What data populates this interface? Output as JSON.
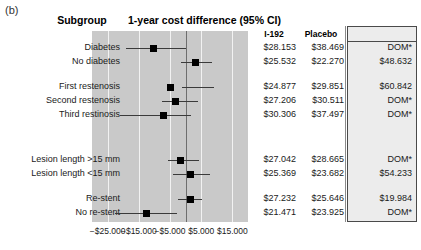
{
  "figure": {
    "panel_label": "(b)",
    "headers": {
      "subgroup": "Subgroup",
      "plot": "1-year cost difference (95% CI)",
      "i192": "I-192",
      "placebo": "Placebo",
      "ce_ratio": "C/E ratio"
    }
  },
  "chart_data": {
    "type": "forest",
    "title": "1-year cost difference (95% CI)",
    "xlabel": "",
    "ylabel": "Subgroup",
    "xlim": [
      -30000,
      20000
    ],
    "grid": true,
    "reference_line": 0,
    "tick_labels": [
      "−$25.000",
      "−$15.000",
      "−$5.000",
      "$5.000",
      "$15.000"
    ],
    "tick_values": [
      -25000,
      -15000,
      -5000,
      5000,
      15000
    ],
    "columns": [
      "Subgroup",
      "1-year cost difference (95% CI)",
      "I-192",
      "Placebo",
      "C/E ratio"
    ],
    "rows": [
      {
        "label": "Diabetes",
        "estimate": -10316,
        "ci_low": -19000,
        "ci_high": 0,
        "i192": "$28.153",
        "placebo": "$38.469",
        "ce_ratio": "DOM*"
      },
      {
        "label": "No diabetes",
        "estimate": 3262,
        "ci_low": -1500,
        "ci_high": 8400,
        "i192": "$25.532",
        "placebo": "$22.270",
        "ce_ratio": "$48.632"
      },
      {
        "label": "First restenosis",
        "estimate": -4974,
        "ci_low": -1200,
        "ci_high": 9200,
        "i192": "$24.877",
        "placebo": "$29.851",
        "ce_ratio": "$60.842"
      },
      {
        "label": "Second restenosis",
        "estimate": -3305,
        "ci_low": -7600,
        "ci_high": 3900,
        "i192": "$27.206",
        "placebo": "$30.511",
        "ce_ratio": "DOM*"
      },
      {
        "label": "Third restinosis",
        "estimate": -7191,
        "ci_low": -21000,
        "ci_high": 1600,
        "i192": "$30.306",
        "placebo": "$37.497",
        "ce_ratio": "DOM*"
      },
      {
        "label": "Lesion length >15 mm",
        "estimate": -1623,
        "ci_low": -5600,
        "ci_high": 4400,
        "i192": "$27.042",
        "placebo": "$28.665",
        "ce_ratio": "DOM*"
      },
      {
        "label": "Lesion length <15 mm",
        "estimate": 1687,
        "ci_low": -4000,
        "ci_high": 7800,
        "i192": "$25.369",
        "placebo": "$23.682",
        "ce_ratio": "$54.233"
      },
      {
        "label": "Re-stent",
        "estimate": 1586,
        "ci_low": -2300,
        "ci_high": 5400,
        "i192": "$27.232",
        "placebo": "$25.646",
        "ce_ratio": "$19.984"
      },
      {
        "label": "No re-stent",
        "estimate": -12454,
        "ci_low": -22500,
        "ci_high": -2600,
        "i192": "$21.471",
        "placebo": "$23.925",
        "ce_ratio": "DOM*"
      }
    ]
  },
  "colors": {
    "plot_background": "#c9c9c9",
    "gridline": "#f2f2f2",
    "reference_line": "#6e6e6e",
    "marker": "#000000",
    "ce_box_background": "#ececec",
    "ce_box_border": "#4a4a4a"
  }
}
